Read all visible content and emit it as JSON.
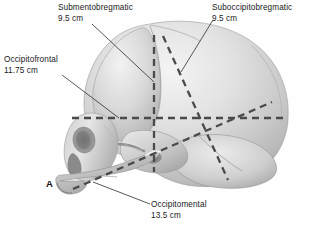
{
  "figure": {
    "panel_letter": "A",
    "background_color": "#fefefe",
    "dashed_line_color": "#4a4a4a",
    "leader_line_color": "#222222",
    "skull_light_color": "#efefef",
    "skull_mid_color": "#c9c9c9",
    "skull_dark_color": "#8d8d8d"
  },
  "annotations": {
    "submentobregmatic": {
      "name": "Submentobregmatic",
      "measurement": "9.5 cm"
    },
    "suboccipitobregmatic": {
      "name": "Suboccipitobregmatic",
      "measurement": "9.5 cm"
    },
    "occipitofrontal": {
      "name": "Occipitofrontal",
      "measurement": "11.75 cm"
    },
    "occipitomental": {
      "name": "Occipitomental",
      "measurement": "13.5 cm"
    }
  }
}
